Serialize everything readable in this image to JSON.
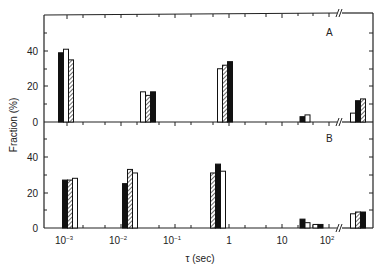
{
  "chart_data": {
    "type": "bar",
    "title": "",
    "xlabel": "τ (sec)",
    "ylabel": "Fraction (%)",
    "x_scale": "log",
    "x_tick_labels": [
      "10⁻³",
      "10⁻²",
      "10⁻¹",
      "1",
      "10",
      "10²"
    ],
    "y_ticks": [
      0,
      20,
      40
    ],
    "ylim": [
      0,
      60
    ],
    "axis_break": "between 10² and last group (//)",
    "bar_styles": [
      "solid",
      "open",
      "hatched"
    ],
    "panels": [
      {
        "label": "A",
        "groups": [
          {
            "tau": "1e-3",
            "bars": [
              {
                "style": "solid",
                "value": 39
              },
              {
                "style": "open",
                "value": 41
              },
              {
                "style": "hatched",
                "value": 35
              }
            ]
          },
          {
            "tau": "3e-2",
            "bars": [
              {
                "style": "open",
                "value": 17
              },
              {
                "style": "hatched",
                "value": 15
              },
              {
                "style": "solid",
                "value": 17
              }
            ]
          },
          {
            "tau": "1.2",
            "bars": [
              {
                "style": "open",
                "value": 30
              },
              {
                "style": "hatched",
                "value": 32
              },
              {
                "style": "solid",
                "value": 34
              }
            ]
          },
          {
            "tau": "40",
            "bars": [
              {
                "style": "solid",
                "value": 3
              },
              {
                "style": "open",
                "value": 4
              }
            ]
          },
          {
            "tau": "after break",
            "bars": [
              {
                "style": "open",
                "value": 5
              },
              {
                "style": "solid",
                "value": 12
              },
              {
                "style": "hatched",
                "value": 13
              }
            ]
          }
        ]
      },
      {
        "label": "B",
        "groups": [
          {
            "tau": "1e-3",
            "bars": [
              {
                "style": "solid",
                "value": 27
              },
              {
                "style": "hatched",
                "value": 27
              },
              {
                "style": "open",
                "value": 28
              }
            ]
          },
          {
            "tau": "2e-2",
            "bars": [
              {
                "style": "solid",
                "value": 25
              },
              {
                "style": "hatched",
                "value": 33
              },
              {
                "style": "open",
                "value": 31
              }
            ]
          },
          {
            "tau": "1",
            "bars": [
              {
                "style": "hatched",
                "value": 31
              },
              {
                "style": "solid",
                "value": 36
              },
              {
                "style": "open",
                "value": 32
              }
            ]
          },
          {
            "tau": "40",
            "bars": [
              {
                "style": "solid",
                "value": 5
              },
              {
                "style": "open",
                "value": 3
              }
            ]
          },
          {
            "tau": "60",
            "bars": [
              {
                "style": "open",
                "value": 2
              },
              {
                "style": "solid",
                "value": 2
              }
            ]
          },
          {
            "tau": "after break",
            "bars": [
              {
                "style": "open",
                "value": 8
              },
              {
                "style": "hatched",
                "value": 9
              },
              {
                "style": "solid",
                "value": 9
              }
            ]
          }
        ]
      }
    ],
    "grid": false,
    "legend": "none"
  },
  "labels": {
    "panel_a": "A",
    "panel_b": "B",
    "xlabel": "τ (sec)",
    "ylabel": "Fraction (%)",
    "y_tick_0": "0",
    "y_tick_20": "20",
    "y_tick_40": "40",
    "x_ticks": [
      "10",
      "10",
      "10",
      "1",
      "10",
      "10"
    ],
    "x_exps": [
      "−3",
      "−2",
      "−1",
      "",
      "",
      "2"
    ]
  }
}
